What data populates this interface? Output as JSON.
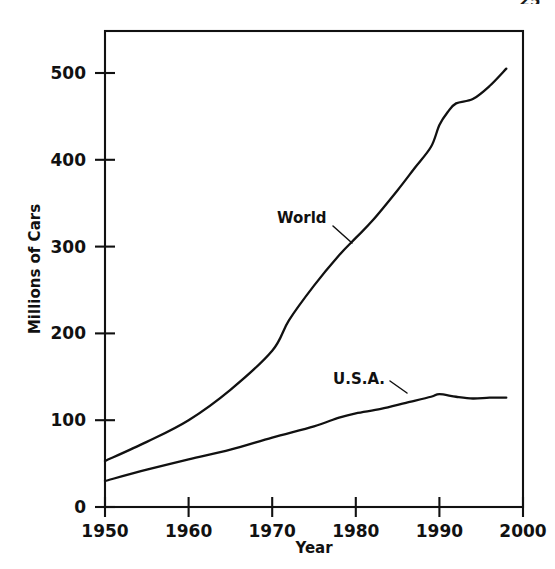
{
  "page": {
    "number": "25"
  },
  "chart_data": {
    "type": "line",
    "title": "",
    "xlabel": "Year",
    "ylabel": "Millions of Cars",
    "xlim": [
      1950,
      2000
    ],
    "ylim": [
      0,
      540
    ],
    "xticks": [
      1950,
      1960,
      1970,
      1980,
      1990,
      2000
    ],
    "xtick_labels": [
      "1950",
      "1960",
      "1970",
      "1980",
      "1990",
      "2000"
    ],
    "yticks": [
      0,
      100,
      200,
      300,
      400,
      500
    ],
    "ytick_labels": [
      "0",
      "100",
      "200",
      "300",
      "400",
      "500"
    ],
    "grid": false,
    "legend": "inline-annotations",
    "line_color": "#111111",
    "series": [
      {
        "name": "World",
        "label": "World",
        "x": [
          1950,
          1955,
          1960,
          1965,
          1970,
          1972,
          1975,
          1978,
          1980,
          1982,
          1985,
          1987,
          1989,
          1990,
          1991,
          1992,
          1994,
          1996,
          1998
        ],
        "values": [
          53,
          75,
          100,
          135,
          180,
          215,
          255,
          290,
          310,
          330,
          365,
          390,
          415,
          440,
          455,
          465,
          470,
          485,
          505
        ]
      },
      {
        "name": "U.S.A.",
        "label": "U.S.A.",
        "x": [
          1950,
          1955,
          1960,
          1965,
          1970,
          1975,
          1978,
          1980,
          1983,
          1986,
          1989,
          1990,
          1992,
          1994,
          1996,
          1998
        ],
        "values": [
          30,
          43,
          55,
          66,
          80,
          93,
          103,
          108,
          113,
          120,
          127,
          130,
          127,
          125,
          126,
          126
        ]
      }
    ],
    "annotations": [
      {
        "text": "World",
        "x": 1977,
        "y": 320
      },
      {
        "text": "U.S.A.",
        "x": 1983,
        "y": 128
      }
    ]
  }
}
